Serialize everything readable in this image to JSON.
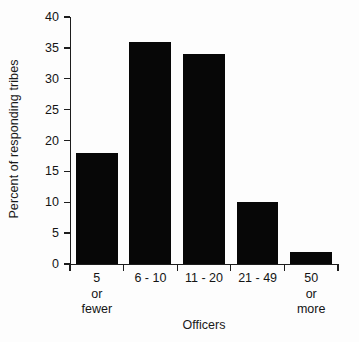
{
  "chart_data": {
    "type": "bar",
    "title": "",
    "subtitle": "",
    "xlabel": "Officers",
    "ylabel": "Percent of responding tribes",
    "categories": [
      "5\nor\nfewer",
      "6 - 10",
      "11 - 20",
      "21 - 49",
      "50\nor\nmore"
    ],
    "category_labels_flat": [
      "5 or fewer",
      "6 - 10",
      "11 - 20",
      "21 - 49",
      "50 or more"
    ],
    "values": [
      18,
      36,
      34,
      10,
      2
    ],
    "ylim": [
      0,
      40
    ],
    "ytick_values": [
      0,
      5,
      10,
      15,
      20,
      25,
      30,
      35,
      40
    ],
    "ytick_labels": [
      "0",
      "5",
      "10",
      "15",
      "20",
      "25",
      "30",
      "35",
      "40"
    ],
    "grid": false,
    "legend": null,
    "bar_color": "#070707",
    "axis_color": "#1d1d1d",
    "background_color": "#fdfdfd"
  }
}
